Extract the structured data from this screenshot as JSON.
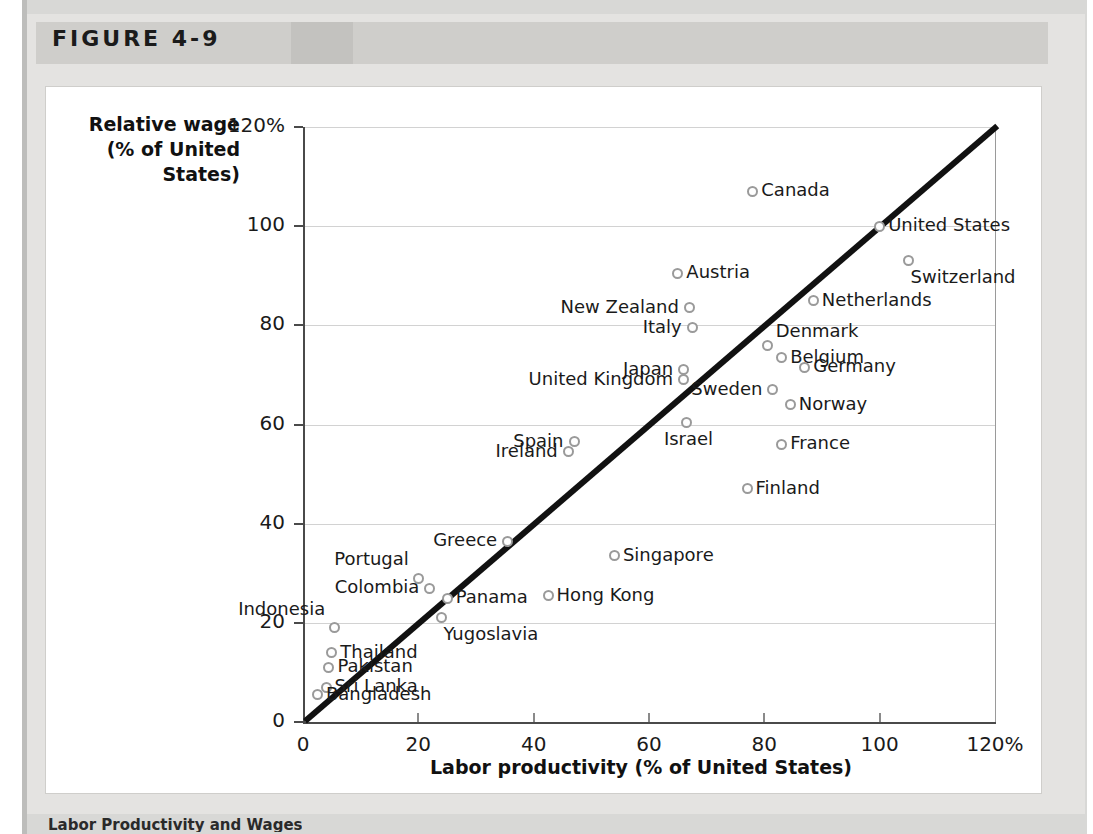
{
  "figure": {
    "label": "FIGURE 4-9",
    "caption": "Labor Productivity and Wages"
  },
  "chart_data": {
    "type": "scatter",
    "title": "",
    "xlabel": "Labor productivity (% of United States)",
    "ylabel": "Relative wage (% of United States)",
    "xlim": [
      0,
      120
    ],
    "ylim": [
      0,
      120
    ],
    "xticks": [
      "0",
      "20",
      "40",
      "60",
      "80",
      "100",
      "120%"
    ],
    "xtick_values": [
      0,
      20,
      40,
      60,
      80,
      100,
      120
    ],
    "yticks": [
      "0",
      "20",
      "40",
      "60",
      "80",
      "100",
      "120%"
    ],
    "ytick_values": [
      0,
      20,
      40,
      60,
      80,
      100,
      120
    ],
    "grid": true,
    "legend": "none",
    "reference_line": {
      "name": "45-degree line",
      "from": [
        0,
        0
      ],
      "to": [
        120,
        120
      ]
    },
    "points": [
      {
        "name": "Canada",
        "x": 78.0,
        "y": 107.0,
        "label_side": "right"
      },
      {
        "name": "United States",
        "x": 100.0,
        "y": 100.0,
        "label_side": "right"
      },
      {
        "name": "Switzerland",
        "x": 105.0,
        "y": 93.0,
        "label_side": "below-right"
      },
      {
        "name": "Austria",
        "x": 65.0,
        "y": 90.5,
        "label_side": "right"
      },
      {
        "name": "Netherlands",
        "x": 88.5,
        "y": 85.0,
        "label_side": "right"
      },
      {
        "name": "New Zealand",
        "x": 67.0,
        "y": 83.5,
        "label_side": "left"
      },
      {
        "name": "Italy",
        "x": 67.5,
        "y": 79.5,
        "label_side": "left"
      },
      {
        "name": "Denmark",
        "x": 80.5,
        "y": 76.0,
        "label_side": "above-right"
      },
      {
        "name": "Belgium",
        "x": 83.0,
        "y": 73.5,
        "label_side": "right"
      },
      {
        "name": "Germany",
        "x": 87.0,
        "y": 71.5,
        "label_side": "right"
      },
      {
        "name": "Japan",
        "x": 66.0,
        "y": 71.0,
        "label_side": "left"
      },
      {
        "name": "United Kingdom",
        "x": 66.0,
        "y": 69.0,
        "label_side": "left"
      },
      {
        "name": "Sweden",
        "x": 81.5,
        "y": 67.0,
        "label_side": "left"
      },
      {
        "name": "Norway",
        "x": 84.5,
        "y": 64.0,
        "label_side": "right"
      },
      {
        "name": "Israel",
        "x": 66.5,
        "y": 60.5,
        "label_side": "below"
      },
      {
        "name": "Spain",
        "x": 47.0,
        "y": 56.5,
        "label_side": "left"
      },
      {
        "name": "France",
        "x": 83.0,
        "y": 56.0,
        "label_side": "right"
      },
      {
        "name": "Ireland",
        "x": 46.0,
        "y": 54.5,
        "label_side": "left"
      },
      {
        "name": "Finland",
        "x": 77.0,
        "y": 47.0,
        "label_side": "right"
      },
      {
        "name": "Greece",
        "x": 35.5,
        "y": 36.5,
        "label_side": "left"
      },
      {
        "name": "Singapore",
        "x": 54.0,
        "y": 33.5,
        "label_side": "right"
      },
      {
        "name": "Portugal",
        "x": 20.0,
        "y": 29.0,
        "label_side": "above-left"
      },
      {
        "name": "Colombia",
        "x": 22.0,
        "y": 27.0,
        "label_side": "left"
      },
      {
        "name": "Panama",
        "x": 25.0,
        "y": 25.0,
        "label_side": "right"
      },
      {
        "name": "Hong Kong",
        "x": 42.5,
        "y": 25.5,
        "label_side": "right"
      },
      {
        "name": "Yugoslavia",
        "x": 24.0,
        "y": 21.0,
        "label_side": "below-right"
      },
      {
        "name": "Indonesia",
        "x": 5.5,
        "y": 19.0,
        "label_side": "above-left"
      },
      {
        "name": "Thailand",
        "x": 5.0,
        "y": 14.0,
        "label_side": "right"
      },
      {
        "name": "Pakistan",
        "x": 4.5,
        "y": 11.0,
        "label_side": "right"
      },
      {
        "name": "Sri Lanka",
        "x": 4.0,
        "y": 7.0,
        "label_side": "right"
      },
      {
        "name": "Bangladesh",
        "x": 2.5,
        "y": 5.5,
        "label_side": "right"
      }
    ]
  },
  "colors": {
    "marker_stroke": "#9a9a9a",
    "line": "#111111",
    "grid": "#d2d2d2",
    "panel_background": "#e4e3e1",
    "header_background": "#cfcecb",
    "card_background": "#ffffff"
  }
}
